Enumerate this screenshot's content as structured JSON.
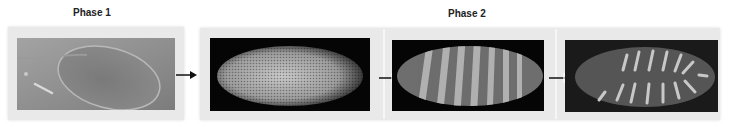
{
  "phases": [
    {
      "label": "Phase 1"
    },
    {
      "label": "Phase 2"
    }
  ],
  "images": [
    {
      "name": "embryo-egg-photo",
      "description": "Brightfield view of an egg"
    },
    {
      "name": "embryo-syncytial-nuclei",
      "description": "Fluorescent embryo with dense nuclei"
    },
    {
      "name": "embryo-stripes",
      "description": "Embryo with stripe pattern"
    },
    {
      "name": "embryo-segments",
      "description": "Segmented embryo with bright stripes"
    }
  ],
  "colors": {
    "panel": "#e9e9e9",
    "image_bg": "#050505",
    "arrow": "#111111"
  }
}
